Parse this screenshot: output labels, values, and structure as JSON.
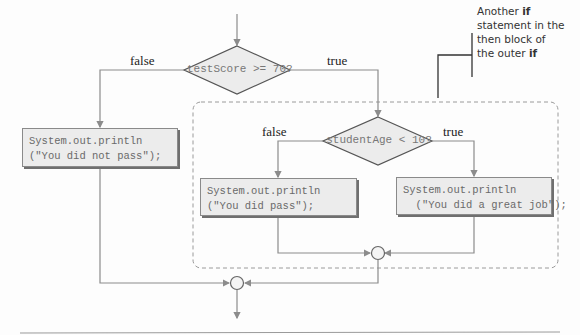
{
  "diagram": {
    "type": "flowchart",
    "outer_condition": "testScore >= 70?",
    "inner_condition": "studentAge < 10?",
    "outer_false_label": "false",
    "outer_true_label": "true",
    "inner_false_label": "false",
    "inner_true_label": "true",
    "box_not_pass": {
      "line1": "System.out.println",
      "line2": "(\"You did not pass\");"
    },
    "box_pass": {
      "line1": "System.out.println",
      "line2": "(\"You did pass\");"
    },
    "box_great": {
      "line1": "System.out.println",
      "line2": "  (\"You did a great job\");"
    },
    "callout": {
      "w1": "Another ",
      "b1": "if",
      "l2": "statement in the",
      "l3": "then block of",
      "w4": "the outer ",
      "b4": "if"
    },
    "colors": {
      "line": "#8c8c8c",
      "diamond_fill": "#ececec",
      "diamond_stroke": "#555555",
      "box_fill": "#ececec",
      "dashed_border": "#9a9a9a",
      "callout_line": "#333333"
    }
  }
}
